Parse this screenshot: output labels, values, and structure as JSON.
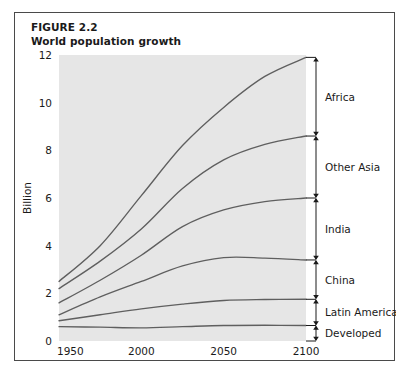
{
  "figure": {
    "number_label": "FIGURE 2.2",
    "title": "World population growth"
  },
  "chart_data": {
    "type": "line",
    "title": "World population growth",
    "subtitle": "FIGURE 2.2",
    "xlabel": "",
    "ylabel": "Billion",
    "xlim": [
      1950,
      2100
    ],
    "ylim": [
      0,
      12
    ],
    "xticks": [
      1950,
      2000,
      2050,
      2100
    ],
    "xtick_labels": [
      "1950",
      "2000",
      "2050",
      "2100"
    ],
    "yticks": [
      0,
      2,
      4,
      6,
      8,
      10,
      12
    ],
    "ytick_labels": [
      "0",
      "2",
      "4",
      "6",
      "8",
      "10",
      "12"
    ],
    "grid": false,
    "legend_position": "right-brackets",
    "stacking": "cumulative",
    "note": "Each line is a cumulative running total; right-side double-headed arrows bracket the band belonging to each region.",
    "x": [
      1950,
      1975,
      2000,
      2025,
      2050,
      2075,
      2100
    ],
    "series": [
      {
        "name": "Developed",
        "cumulative_values": [
          0.6,
          0.58,
          0.55,
          0.6,
          0.65,
          0.66,
          0.65
        ],
        "band_values": [
          0.6,
          0.58,
          0.55,
          0.6,
          0.65,
          0.66,
          0.65
        ]
      },
      {
        "name": "Latin America",
        "cumulative_values": [
          0.85,
          1.1,
          1.35,
          1.55,
          1.7,
          1.74,
          1.75
        ],
        "band_values": [
          0.25,
          0.52,
          0.8,
          0.95,
          1.05,
          1.08,
          1.1
        ]
      },
      {
        "name": "China",
        "cumulative_values": [
          1.1,
          1.85,
          2.5,
          3.15,
          3.5,
          3.48,
          3.4
        ],
        "band_values": [
          0.25,
          0.75,
          1.15,
          1.6,
          1.8,
          1.74,
          1.65
        ]
      },
      {
        "name": "India",
        "cumulative_values": [
          1.6,
          2.55,
          3.6,
          4.8,
          5.5,
          5.85,
          6.0
        ],
        "band_values": [
          0.5,
          0.7,
          1.1,
          1.65,
          2.0,
          2.37,
          2.6
        ]
      },
      {
        "name": "Other Asia",
        "cumulative_values": [
          2.2,
          3.35,
          4.7,
          6.4,
          7.6,
          8.25,
          8.6
        ],
        "band_values": [
          0.6,
          0.8,
          1.1,
          1.6,
          2.1,
          2.4,
          2.6
        ]
      },
      {
        "name": "Africa",
        "cumulative_values": [
          2.5,
          4.0,
          6.1,
          8.2,
          9.8,
          11.1,
          11.9
        ],
        "band_values": [
          0.3,
          0.65,
          1.4,
          1.8,
          2.2,
          2.85,
          3.3
        ]
      }
    ],
    "region_labels_top_to_bottom": [
      "Africa",
      "Other Asia",
      "India",
      "China",
      "Latin America",
      "Developed"
    ],
    "endpoint_values_2100": {
      "Africa_top": 11.9,
      "Other_Asia_top": 8.6,
      "India_top": 6.0,
      "China_top": 3.4,
      "Latin_America_top": 1.75,
      "Developed_top": 0.65
    },
    "colors": {
      "plot_background": "#e6e6e6",
      "line": "#5f5f5f",
      "text": "#1a1a1a",
      "frame_border": "#4a4a4a",
      "page_background": "#ffffff"
    }
  }
}
